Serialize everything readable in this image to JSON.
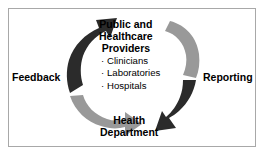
{
  "diagram": {
    "type": "cycle",
    "frame": {
      "border_color": "#a8a8a8",
      "background_color": "#ffffff"
    },
    "nodes": [
      {
        "id": "providers",
        "label": "Public and\nHealthcare\nProviders",
        "line1": "Public and",
        "line2": "Healthcare",
        "line3": "Providers",
        "position": "top",
        "items": [
          "Clinicians",
          "Laboratories",
          "Hospitals"
        ],
        "bullet_glyph": "·"
      },
      {
        "id": "health-department",
        "label": "Health\nDepartment",
        "line1": "Health",
        "line2": "Department",
        "position": "bottom",
        "items": []
      }
    ],
    "arrows": [
      {
        "id": "reporting-arrow",
        "label": "Reporting",
        "color": "#999999",
        "from": "providers",
        "to": "health-department",
        "side": "right",
        "direction": "clockwise-down"
      },
      {
        "id": "feedback-arrow",
        "label": "Feedback",
        "color": "#2b2b2b",
        "from": "health-department",
        "to": "providers",
        "side": "left",
        "direction": "clockwise-up"
      }
    ],
    "colors": {
      "dark_arrow": "#2b2b2b",
      "gray_arrow": "#999999",
      "text": "#000000",
      "border": "#a8a8a8"
    }
  }
}
